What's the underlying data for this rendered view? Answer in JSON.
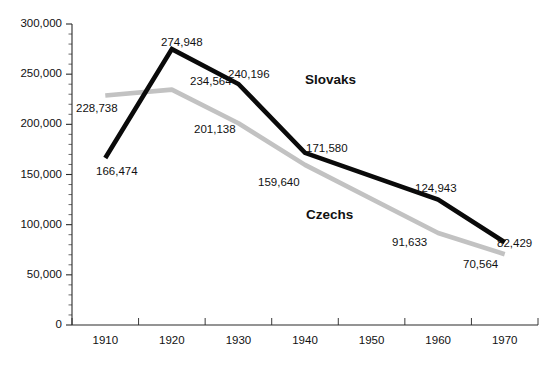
{
  "chart_data": {
    "type": "line",
    "title": "",
    "subtitle": "",
    "xlabel": "",
    "ylabel": "",
    "x": [
      1910,
      1920,
      1930,
      1940,
      1950,
      1960,
      1970
    ],
    "categories": [
      "1910",
      "1920",
      "1930",
      "1940",
      "1950",
      "1960",
      "1970"
    ],
    "xlim": [
      1905,
      1975
    ],
    "ylim": [
      0,
      300000
    ],
    "y_ticks": [
      0,
      50000,
      100000,
      150000,
      200000,
      250000,
      300000
    ],
    "y_tick_labels": [
      "0",
      "50,000",
      "100,000",
      "150,000",
      "200,000",
      "250,000",
      "300,000"
    ],
    "y_minor_tick_step": 10000,
    "grid": false,
    "legend_position": "inline-annotation",
    "series": [
      {
        "name": "Slovaks",
        "color": "#0a0a0a",
        "x": [
          1910,
          1920,
          1930,
          1940,
          1960,
          1970
        ],
        "values": [
          166474,
          274948,
          240196,
          171580,
          124943,
          82429
        ],
        "value_labels": [
          "166,474",
          "274,948",
          "240,196",
          "171,580",
          "124,943",
          "82,429"
        ]
      },
      {
        "name": "Czechs",
        "color": "#c2c2c2",
        "x": [
          1910,
          1920,
          1930,
          1940,
          1960,
          1970
        ],
        "values": [
          228738,
          234564,
          201138,
          159640,
          91633,
          70564
        ],
        "value_labels": [
          "228,738",
          "234,564",
          "201,138",
          "159,640",
          "91,633",
          "70,564"
        ]
      }
    ],
    "annotations": [
      {
        "name": "slovaks-series-label",
        "text": "Slovaks",
        "x": 305,
        "y": 84
      },
      {
        "name": "czechs-series-label",
        "text": "Czechs",
        "x": 306,
        "y": 219
      },
      {
        "name": "point-label-166474",
        "text": "166,474",
        "x": 96,
        "y": 175
      },
      {
        "name": "point-label-274948",
        "text": "274,948",
        "x": 161,
        "y": 46
      },
      {
        "name": "point-label-240196",
        "text": "240,196",
        "x": 228,
        "y": 78
      },
      {
        "name": "point-label-171580",
        "text": "171,580",
        "x": 306,
        "y": 152
      },
      {
        "name": "point-label-124943",
        "text": "124,943",
        "x": 415,
        "y": 192
      },
      {
        "name": "point-label-82429",
        "text": "82,429",
        "x": 497,
        "y": 247
      },
      {
        "name": "point-label-228738",
        "text": "228,738",
        "x": 76,
        "y": 112
      },
      {
        "name": "point-label-234564",
        "text": "234,564",
        "x": 190,
        "y": 85
      },
      {
        "name": "point-label-201138",
        "text": "201,138",
        "x": 194,
        "y": 133
      },
      {
        "name": "point-label-159640",
        "text": "159,640",
        "x": 258,
        "y": 186
      },
      {
        "name": "point-label-91633",
        "text": "91,633",
        "x": 392,
        "y": 246
      },
      {
        "name": "point-label-70564",
        "text": "70,564",
        "x": 463,
        "y": 268
      }
    ]
  },
  "axes": {
    "y_axis_name": "population-axis",
    "x_axis_name": "year-axis",
    "y_labels": [
      "300,000",
      "250,000",
      "200,000",
      "150,000",
      "100,000",
      "50,000",
      "0"
    ],
    "x_labels": [
      "1910",
      "1920",
      "1930",
      "1940",
      "1950",
      "1960",
      "1970"
    ]
  },
  "colors": {
    "slovaks_line": "#0a0a0a",
    "czechs_line": "#c2c2c2",
    "axis": "#2b2b2b",
    "text": "#111111",
    "background": "#ffffff"
  }
}
